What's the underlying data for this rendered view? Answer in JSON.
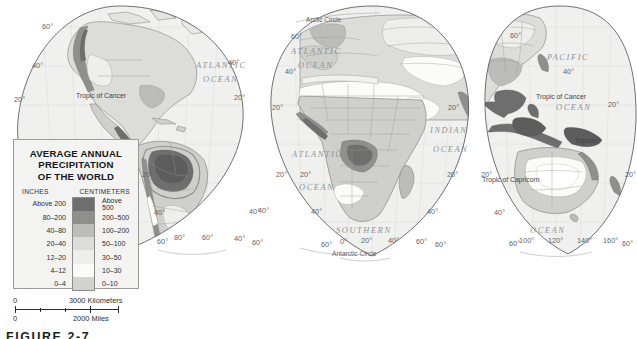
{
  "figure": {
    "caption": "FIGURE 2-7"
  },
  "legend": {
    "title_lines": [
      "AVERAGE ANNUAL",
      "PRECIPITATION",
      "OF THE WORLD"
    ],
    "col_headers": {
      "inches": "INCHES",
      "centimeters": "CENTIMETERS"
    },
    "rows": [
      {
        "inches": "Above 200",
        "centimeters": "Above 500",
        "color": "#6e6e6e"
      },
      {
        "inches": "80–200",
        "centimeters": "200–500",
        "color": "#8f8f8c"
      },
      {
        "inches": "40–80",
        "centimeters": "100–200",
        "color": "#bcbcb8"
      },
      {
        "inches": "20–40",
        "centimeters": "50–100",
        "color": "#dcdcd8"
      },
      {
        "inches": "12–20",
        "centimeters": "30–50",
        "color": "#eeeeea"
      },
      {
        "inches": "4–12",
        "centimeters": "10–30",
        "color": "#fbfbf8"
      },
      {
        "inches": "0–4",
        "centimeters": "0–10",
        "color": "#d2d2ce"
      }
    ]
  },
  "scale": {
    "km": {
      "start": "0",
      "end": "3000 Kilometers"
    },
    "mi": {
      "start": "0",
      "end": "2000 Miles"
    }
  },
  "map": {
    "ocean_labels": [
      {
        "text": "ATLANTIC",
        "x": 196,
        "y": 68
      },
      {
        "text": "OCEAN",
        "x": 203,
        "y": 82
      },
      {
        "text": "ATLANTIC",
        "x": 300,
        "y": 157
      },
      {
        "text": "OCEAN",
        "x": 306,
        "y": 190
      },
      {
        "text": "ATLANTIC",
        "x": 300,
        "y": 54
      },
      {
        "text": "OCEAN",
        "x": 305,
        "y": 68
      },
      {
        "text": "INDIAN",
        "x": 433,
        "y": 133
      },
      {
        "text": "OCEAN",
        "x": 436,
        "y": 152
      },
      {
        "text": "SOUTHERN",
        "x": 345,
        "y": 233
      },
      {
        "text": "PACIFIC",
        "x": 552,
        "y": 60
      },
      {
        "text": "OCEAN",
        "x": 560,
        "y": 110
      },
      {
        "text": "OCEAN",
        "x": 536,
        "y": 233
      }
    ],
    "latitude_labels": [
      {
        "text": "60°",
        "x": 45,
        "y": 27
      },
      {
        "text": "40°",
        "x": 35,
        "y": 66
      },
      {
        "text": "20°",
        "x": 17,
        "y": 100
      },
      {
        "text": "20°",
        "x": 238,
        "y": 98
      },
      {
        "text": "40°",
        "x": 232,
        "y": 63
      },
      {
        "text": "20°",
        "x": 145,
        "y": 175
      },
      {
        "text": "20°",
        "x": 174,
        "y": 175
      },
      {
        "text": "40°",
        "x": 157,
        "y": 213
      },
      {
        "text": "40°",
        "x": 253,
        "y": 212
      },
      {
        "text": "60°",
        "x": 294,
        "y": 37
      },
      {
        "text": "40°",
        "x": 288,
        "y": 72
      },
      {
        "text": "20°",
        "x": 275,
        "y": 108
      },
      {
        "text": "20°",
        "x": 279,
        "y": 175
      },
      {
        "text": "20°",
        "x": 303,
        "y": 175
      },
      {
        "text": "40°",
        "x": 261,
        "y": 211
      },
      {
        "text": "40°",
        "x": 314,
        "y": 212
      },
      {
        "text": "20°",
        "x": 450,
        "y": 175
      },
      {
        "text": "20°",
        "x": 451,
        "y": 108
      },
      {
        "text": "40°",
        "x": 430,
        "y": 212
      },
      {
        "text": "60°",
        "x": 513,
        "y": 36
      },
      {
        "text": "40°",
        "x": 566,
        "y": 72
      },
      {
        "text": "20°",
        "x": 612,
        "y": 105
      },
      {
        "text": "20°",
        "x": 484,
        "y": 175
      },
      {
        "text": "20°",
        "x": 629,
        "y": 175
      },
      {
        "text": "40°",
        "x": 497,
        "y": 213
      }
    ],
    "longitude_labels": [
      {
        "text": "60°",
        "x": 160,
        "y": 242
      },
      {
        "text": "80°",
        "x": 177,
        "y": 238
      },
      {
        "text": "60°",
        "x": 205,
        "y": 238
      },
      {
        "text": "40°",
        "x": 237,
        "y": 239
      },
      {
        "text": "60°",
        "x": 255,
        "y": 243
      },
      {
        "text": "60°",
        "x": 325,
        "y": 245
      },
      {
        "text": "0°",
        "x": 343,
        "y": 242
      },
      {
        "text": "20°",
        "x": 365,
        "y": 241
      },
      {
        "text": "40°",
        "x": 392,
        "y": 241
      },
      {
        "text": "60°",
        "x": 420,
        "y": 242
      },
      {
        "text": "60°",
        "x": 438,
        "y": 245
      },
      {
        "text": "60°",
        "x": 512,
        "y": 244
      },
      {
        "text": "100°",
        "x": 524,
        "y": 241
      },
      {
        "text": "120°",
        "x": 552,
        "y": 241
      },
      {
        "text": "140°",
        "x": 581,
        "y": 241
      },
      {
        "text": "160°",
        "x": 607,
        "y": 241
      },
      {
        "text": "60°",
        "x": 625,
        "y": 244
      }
    ],
    "special_lines": [
      {
        "text": "Tropic of Cancer",
        "x": 78,
        "y": 96,
        "cls": "tropic"
      },
      {
        "text": "Tropic of Cancer",
        "x": 541,
        "y": 97,
        "cls": "tropic"
      },
      {
        "text": "Tropic of Capricorn",
        "x": 486,
        "y": 180,
        "cls": "tropic"
      },
      {
        "text": "Equator",
        "x": 580,
        "y": 141,
        "cls": "tropic"
      },
      {
        "text": "Arctic Circle",
        "x": 311,
        "y": 20,
        "cls": "circle-lbl"
      },
      {
        "text": "Antarctic Circle",
        "x": 337,
        "y": 254,
        "cls": "circle-lbl"
      }
    ]
  }
}
